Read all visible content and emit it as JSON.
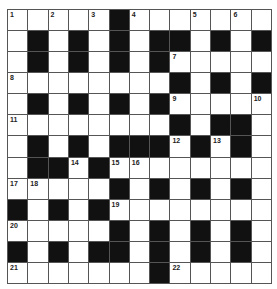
{
  "puzzle": {
    "rows": 13,
    "cols": 13,
    "colors": {
      "black": "#111111",
      "white": "#ffffff",
      "line": "#555555"
    },
    "grid": [
      "WWWWWBWWWWWWW",
      "WBWBWBWBBWBWB",
      "WBWBWBWBWWWWW",
      "WWWWWWWWBWBWB",
      "WBWBWBWBWWWWW",
      "WWWWWWWWBWBBW",
      "WBWBWBBBWBWBW",
      "WBBWBWWWWWWWW",
      "WWWWWBWBWBWBW",
      "BWBWBWWWWWWWW",
      "WWWWWBWBWBWBW",
      "BWBWBBWBWBWBW",
      "WWWWWWWBWWWWW"
    ],
    "numbers": [
      {
        "r": 0,
        "c": 0,
        "n": "1"
      },
      {
        "r": 0,
        "c": 2,
        "n": "2"
      },
      {
        "r": 0,
        "c": 4,
        "n": "3"
      },
      {
        "r": 0,
        "c": 6,
        "n": "4"
      },
      {
        "r": 0,
        "c": 9,
        "n": "5"
      },
      {
        "r": 0,
        "c": 11,
        "n": "6"
      },
      {
        "r": 2,
        "c": 8,
        "n": "7"
      },
      {
        "r": 3,
        "c": 0,
        "n": "8"
      },
      {
        "r": 4,
        "c": 8,
        "n": "9"
      },
      {
        "r": 4,
        "c": 12,
        "n": "10"
      },
      {
        "r": 5,
        "c": 0,
        "n": "11"
      },
      {
        "r": 6,
        "c": 8,
        "n": "12"
      },
      {
        "r": 6,
        "c": 10,
        "n": "13"
      },
      {
        "r": 7,
        "c": 3,
        "n": "14"
      },
      {
        "r": 7,
        "c": 5,
        "n": "15"
      },
      {
        "r": 7,
        "c": 6,
        "n": "16"
      },
      {
        "r": 8,
        "c": 0,
        "n": "17"
      },
      {
        "r": 8,
        "c": 1,
        "n": "18"
      },
      {
        "r": 9,
        "c": 5,
        "n": "19"
      },
      {
        "r": 10,
        "c": 0,
        "n": "20"
      },
      {
        "r": 12,
        "c": 0,
        "n": "21"
      },
      {
        "r": 12,
        "c": 8,
        "n": "22"
      }
    ]
  }
}
